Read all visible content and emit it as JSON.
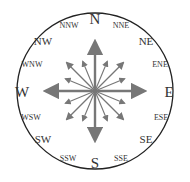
{
  "diagram": {
    "type": "compass-rose",
    "colors": {
      "ring": "#222222",
      "arrow": "#777777",
      "text": "#333333"
    },
    "labels": {
      "N": "N",
      "NNE": "NNE",
      "NE": "NE",
      "ENE": "ENE",
      "E": "E",
      "ESE": "ESE",
      "SE": "SE",
      "SSE": "SSE",
      "S": "S",
      "SSW": "SSW",
      "SW": "SW",
      "WSW": "WSW",
      "W": "W",
      "WNW": "WNW",
      "NW": "NW",
      "NNW": "NNW"
    }
  }
}
